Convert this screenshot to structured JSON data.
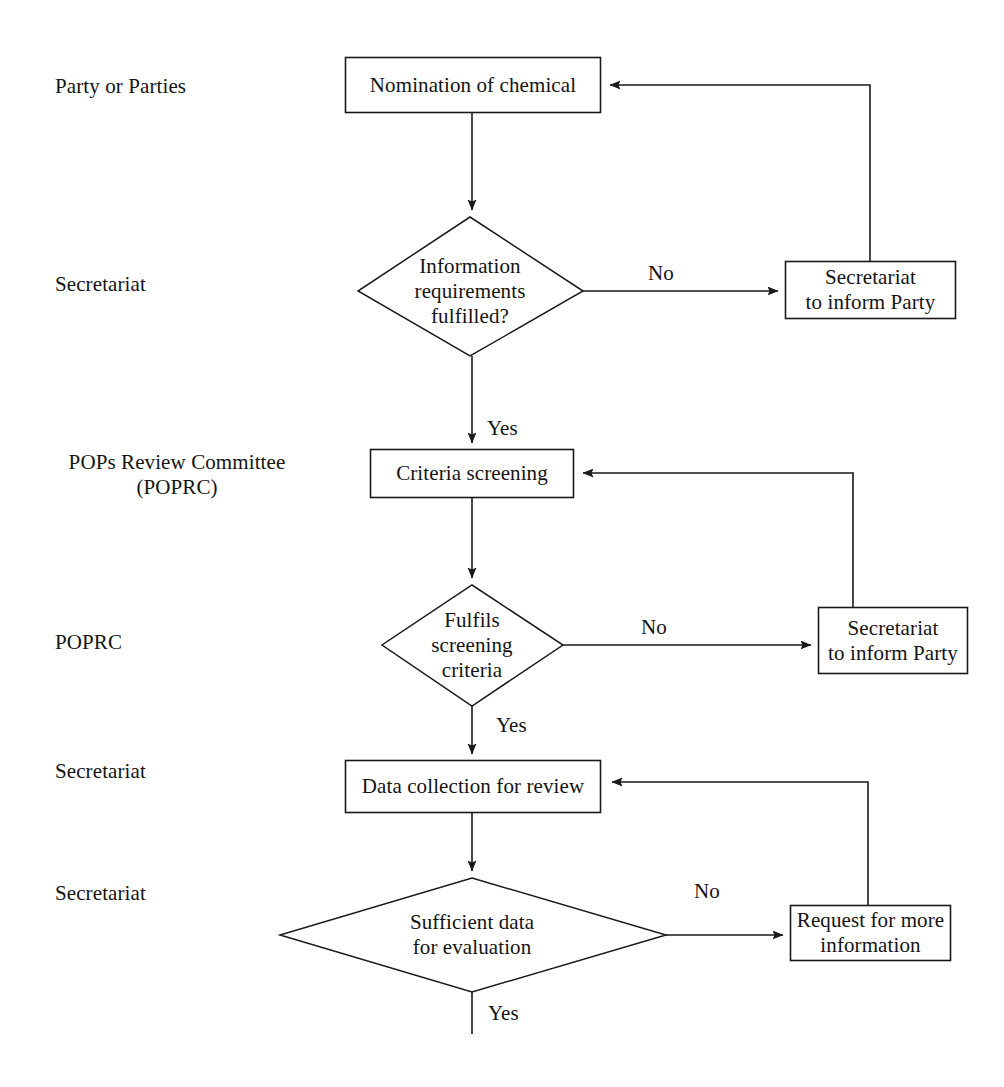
{
  "document": {
    "title": "POPs chemical review process flowchart",
    "background_color": "#ffffff",
    "line_color": "#1a1a1a"
  },
  "swimlanes": [
    {
      "id": "party-or-parties",
      "label": "Party or Parties"
    },
    {
      "id": "secretariat-1",
      "label": "Secretariat"
    },
    {
      "id": "poprc-committee",
      "label": "POPs Review Committee\n(POPRC)"
    },
    {
      "id": "poprc",
      "label": "POPRC"
    },
    {
      "id": "secretariat-2",
      "label": "Secretariat"
    },
    {
      "id": "secretariat-3",
      "label": "Secretariat"
    }
  ],
  "nodes": [
    {
      "id": "nomination-of-chemical",
      "shape": "process",
      "label": "Nomination of chemical"
    },
    {
      "id": "information-requirements-fulfilled",
      "shape": "decision",
      "label": "Information\nrequirements\nfulfilled?"
    },
    {
      "id": "secretariat-to-inform-party-1",
      "shape": "process",
      "label": "Secretariat\nto inform Party"
    },
    {
      "id": "criteria-screening",
      "shape": "process",
      "label": "Criteria screening"
    },
    {
      "id": "fulfils-screening-criteria",
      "shape": "decision",
      "label": "Fulfils\nscreening\ncriteria"
    },
    {
      "id": "secretariat-to-inform-party-2",
      "shape": "process",
      "label": "Secretariat\nto inform Party"
    },
    {
      "id": "data-collection-for-review",
      "shape": "process",
      "label": "Data collection for review"
    },
    {
      "id": "sufficient-data-for-evaluation",
      "shape": "decision",
      "label": "Sufficient data\nfor evaluation"
    },
    {
      "id": "request-for-more-information",
      "shape": "process",
      "label": "Request for more\ninformation"
    }
  ],
  "edge_labels": [
    {
      "id": "no-1",
      "text": "No"
    },
    {
      "id": "yes-1",
      "text": "Yes"
    },
    {
      "id": "no-2",
      "text": "No"
    },
    {
      "id": "yes-2",
      "text": "Yes"
    },
    {
      "id": "no-3",
      "text": "No"
    },
    {
      "id": "yes-3",
      "text": "Yes"
    }
  ]
}
